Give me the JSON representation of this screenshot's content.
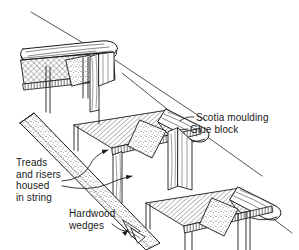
{
  "figure": {
    "background_color": "#ffffff",
    "ink_color": "#1a1a1a",
    "width": 299,
    "height": 250
  },
  "labels": {
    "scotia_moulding": "Scotia moulding",
    "glue_block": "Glue block",
    "treads_and_risers": "Treads\nand risers\nhoused\nin string",
    "hardwood_wedges": "Hardwood\nwedges"
  },
  "parts": {
    "tread_top": "tread",
    "tread_middle": "tread",
    "tread_bottom": "tread",
    "riser_top": "riser",
    "riser_middle": "riser",
    "riser_bottom": "riser",
    "string": "string",
    "glue_block_top": "glue block",
    "glue_block_middle": "glue block",
    "glue_block_bottom": "glue block",
    "scotia_top": "scotia moulding",
    "scotia_middle": "scotia moulding",
    "scotia_bottom": "scotia moulding",
    "wedges": "hardwood wedges"
  }
}
